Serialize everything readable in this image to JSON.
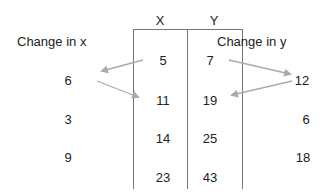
{
  "table": {
    "headers": [
      "X",
      "Y"
    ],
    "rows": [
      {
        "x": "5",
        "y": "7"
      },
      {
        "x": "11",
        "y": "19"
      },
      {
        "x": "14",
        "y": "25"
      },
      {
        "x": "23",
        "y": "43"
      }
    ]
  },
  "change_x": {
    "label": "Change in x",
    "values": [
      "6",
      "3",
      "9"
    ]
  },
  "change_y": {
    "label": "Change in y",
    "values": [
      "12",
      "6",
      "18"
    ]
  },
  "colors": {
    "arrow": "#aaaaaa",
    "border": "#777777"
  }
}
